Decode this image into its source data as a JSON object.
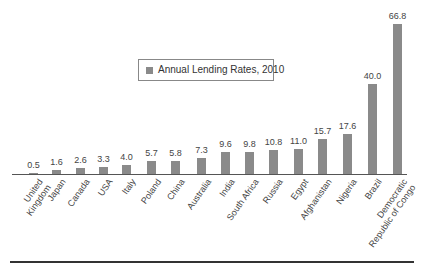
{
  "chart_data": {
    "type": "bar",
    "title": "",
    "xlabel": "",
    "ylabel": "",
    "legend": {
      "entries": [
        "Annual Lending Rates, 2010"
      ],
      "position": "upper-center"
    },
    "grid": false,
    "ylim": [
      0,
      70
    ],
    "categories": [
      "United Kingdom",
      "Japan",
      "Canada",
      "USA",
      "Italy",
      "Poland",
      "China",
      "Australia",
      "India",
      "South Africa",
      "Russia",
      "Egypt",
      "Afghanistan",
      "Nigeria",
      "Brazil",
      "Democratic Republic of Congo"
    ],
    "category_labels": [
      [
        "United",
        "Kingdom"
      ],
      [
        "Japan"
      ],
      [
        "Canada"
      ],
      [
        "USA"
      ],
      [
        "Italy"
      ],
      [
        "Poland"
      ],
      [
        "China"
      ],
      [
        "Australia"
      ],
      [
        "India"
      ],
      [
        "South Africa"
      ],
      [
        "Russia"
      ],
      [
        "Egypt"
      ],
      [
        "Afghanistan"
      ],
      [
        "Nigeria"
      ],
      [
        "Brazil"
      ],
      [
        "Democratic",
        "Republic of Congo"
      ]
    ],
    "series": [
      {
        "name": "Annual Lending Rates, 2010",
        "values": [
          0.5,
          1.6,
          2.6,
          3.3,
          4.0,
          5.7,
          5.8,
          7.3,
          9.6,
          9.8,
          10.8,
          11.0,
          15.7,
          17.6,
          40.0,
          66.8
        ],
        "labels": [
          "0.5",
          "1.6",
          "2.6",
          "3.3",
          "4.0",
          "5.7",
          "5.8",
          "7.3",
          "9.6",
          "9.8",
          "10.8",
          "11.0",
          "15.7",
          "17.6",
          "40.0",
          "66.8"
        ],
        "color": "#8a8a8a"
      }
    ]
  },
  "legend": {
    "label": "Annual Lending Rates, 2010",
    "swatch_color": "#8a8a8a"
  },
  "layout": {
    "bar_x": [
      29,
      52,
      76,
      99,
      122,
      147,
      171,
      197,
      221,
      245,
      269,
      294,
      318,
      343,
      368,
      393
    ],
    "baseline_y": 174,
    "px_per_unit": 2.245
  }
}
